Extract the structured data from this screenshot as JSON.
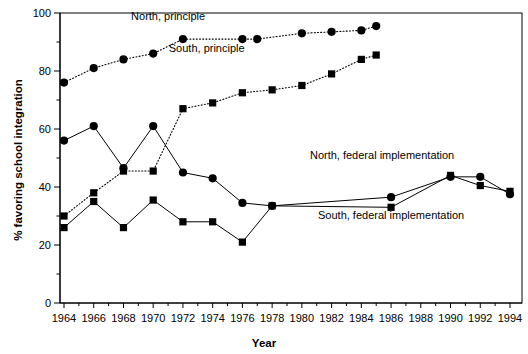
{
  "chart_data": {
    "type": "line",
    "title": "",
    "xlabel": "Year",
    "ylabel": "% favoring school integration",
    "xlim": [
      1963,
      1995
    ],
    "ylim": [
      0,
      100
    ],
    "grid": false,
    "legend": "inline-annotations",
    "x_ticks": [
      1964,
      1966,
      1968,
      1970,
      1972,
      1974,
      1976,
      1978,
      1980,
      1982,
      1984,
      1986,
      1988,
      1990,
      1992,
      1994
    ],
    "y_ticks": [
      0,
      20,
      40,
      60,
      80,
      100
    ],
    "y_minor_ticks": [
      10,
      30,
      50,
      70,
      90
    ],
    "series": [
      {
        "name": "North, principle",
        "marker": "circle",
        "line": "dotted",
        "label_x": 1971.0,
        "label_y": 97.5,
        "points": [
          {
            "x": 1964,
            "y": 76
          },
          {
            "x": 1966,
            "y": 81
          },
          {
            "x": 1968,
            "y": 84
          },
          {
            "x": 1970,
            "y": 86
          },
          {
            "x": 1972,
            "y": 91
          },
          {
            "x": 1976,
            "y": 91
          },
          {
            "x": 1977,
            "y": 91
          },
          {
            "x": 1980,
            "y": 93
          },
          {
            "x": 1982,
            "y": 93.5
          },
          {
            "x": 1984,
            "y": 94
          },
          {
            "x": 1985,
            "y": 95.5
          }
        ]
      },
      {
        "name": "South, principle",
        "marker": "square",
        "line": "dotted",
        "label_x": 1973.6,
        "label_y": 86.5,
        "points": [
          {
            "x": 1964,
            "y": 30
          },
          {
            "x": 1966,
            "y": 38
          },
          {
            "x": 1968,
            "y": 45.5
          },
          {
            "x": 1970,
            "y": 45.5
          },
          {
            "x": 1972,
            "y": 67
          },
          {
            "x": 1974,
            "y": 69
          },
          {
            "x": 1976,
            "y": 72.5
          },
          {
            "x": 1978,
            "y": 73.5
          },
          {
            "x": 1980,
            "y": 75
          },
          {
            "x": 1982,
            "y": 79
          },
          {
            "x": 1984,
            "y": 84
          },
          {
            "x": 1985,
            "y": 85.5
          }
        ]
      },
      {
        "name": "North, federal implementation",
        "marker": "circle",
        "line": "solid",
        "label_x": 1985.4,
        "label_y": 49.5,
        "points": [
          {
            "x": 1964,
            "y": 56
          },
          {
            "x": 1966,
            "y": 61
          },
          {
            "x": 1968,
            "y": 46.5
          },
          {
            "x": 1970,
            "y": 61
          },
          {
            "x": 1972,
            "y": 45
          },
          {
            "x": 1974,
            "y": 43
          },
          {
            "x": 1976,
            "y": 34.5
          },
          {
            "x": 1978,
            "y": 33.5
          },
          {
            "x": 1986,
            "y": 36.5
          },
          {
            "x": 1990,
            "y": 43.5
          },
          {
            "x": 1992,
            "y": 43.5
          },
          {
            "x": 1994,
            "y": 37.5
          }
        ]
      },
      {
        "name": "South, federal implementation",
        "marker": "square",
        "line": "solid",
        "label_x": 1986.0,
        "label_y": 29.0,
        "points": [
          {
            "x": 1964,
            "y": 26
          },
          {
            "x": 1966,
            "y": 35
          },
          {
            "x": 1968,
            "y": 26
          },
          {
            "x": 1970,
            "y": 35.5
          },
          {
            "x": 1972,
            "y": 28
          },
          {
            "x": 1974,
            "y": 28
          },
          {
            "x": 1976,
            "y": 21
          },
          {
            "x": 1978,
            "y": 33.5
          },
          {
            "x": 1986,
            "y": 33
          },
          {
            "x": 1990,
            "y": 44
          },
          {
            "x": 1992,
            "y": 40.5
          },
          {
            "x": 1994,
            "y": 38.5
          }
        ]
      }
    ]
  }
}
